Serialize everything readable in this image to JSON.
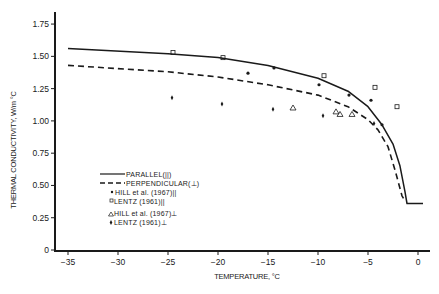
{
  "chart_data": {
    "type": "line",
    "title": "",
    "xlabel": "TEMPERATURE, °C",
    "ylabel": "THERMAL CONDUCTIVITY, W/m °C",
    "xlim": [
      -36,
      1
    ],
    "ylim": [
      0,
      1.8
    ],
    "x_ticks": [
      -35,
      -30,
      -25,
      -20,
      -15,
      -10,
      -5,
      0
    ],
    "x_tick_labels": [
      "−35",
      "−30",
      "−25",
      "−20",
      "−15",
      "−10",
      "−5",
      "0"
    ],
    "y_ticks": [
      0,
      0.25,
      0.5,
      0.75,
      1.0,
      1.25,
      1.5,
      1.75
    ],
    "y_tick_labels": [
      "0",
      "0.25",
      "0.50",
      "0.75",
      "1.00",
      "1.25",
      "1.50",
      "1.75"
    ],
    "grid": false,
    "legend_position": "lower-left inside plot",
    "series": [
      {
        "name": "PARALLEL(||)",
        "style": "solid-line",
        "x": [
          -35,
          -25,
          -20,
          -15,
          -10,
          -7,
          -5,
          -3.6,
          -2.5,
          -1.8,
          -1.3,
          -1.1,
          0.5
        ],
        "y": [
          1.56,
          1.52,
          1.49,
          1.43,
          1.33,
          1.23,
          1.11,
          0.97,
          0.82,
          0.65,
          0.45,
          0.36,
          0.36
        ]
      },
      {
        "name": "PERPENDICULAR(⊥)",
        "style": "dashed-line",
        "x": [
          -35,
          -25,
          -20,
          -15,
          -10,
          -7,
          -5,
          -4,
          -3,
          -2.3,
          -1.6,
          -1.3
        ],
        "y": [
          1.43,
          1.38,
          1.34,
          1.28,
          1.2,
          1.11,
          1.01,
          0.93,
          0.8,
          0.62,
          0.42,
          0.38
        ]
      },
      {
        "name": "HILL et al. (1967)||",
        "style": "dot-marker",
        "x": [
          -17,
          -14.4,
          -9.9,
          -6.9,
          -4.7,
          -3.6
        ],
        "y": [
          1.37,
          1.41,
          1.28,
          1.2,
          1.16,
          0.97
        ]
      },
      {
        "name": "LENTZ (1961)||",
        "style": "square-marker",
        "x": [
          -24.5,
          -19.5,
          -9.4,
          -4.3,
          -2.1
        ],
        "y": [
          1.53,
          1.49,
          1.35,
          1.26,
          1.11
        ]
      },
      {
        "name": "HILL et al. (1967)⊥",
        "style": "triangle-marker",
        "x": [
          -12.5,
          -8.2,
          -7.8,
          -6.6
        ],
        "y": [
          1.1,
          1.07,
          1.05,
          1.05
        ]
      },
      {
        "name": "LENTZ (1961)⊥",
        "style": "diamond-marker",
        "x": [
          -24.6,
          -19.6,
          -14.5,
          -9.5,
          -4.4
        ],
        "y": [
          1.18,
          1.13,
          1.09,
          1.04,
          0.98
        ]
      }
    ]
  },
  "legend": {
    "items": [
      {
        "label": "PARALLEL(||)"
      },
      {
        "label": "PERPENDICULAR(⊥)"
      },
      {
        "label": "HILL et al. (1967)||"
      },
      {
        "label": "LENTZ (1961)||"
      },
      {
        "label": "HILL et al. (1967)⊥"
      },
      {
        "label": "LENTZ (1961)⊥"
      }
    ]
  },
  "colors": {
    "ink": "#1a1a1a",
    "background": "#ffffff"
  }
}
